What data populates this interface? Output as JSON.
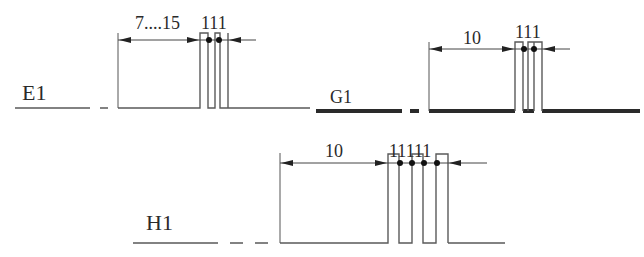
{
  "diagram": {
    "signals": [
      {
        "id": "E1",
        "label": "E1",
        "dimensions": {
          "lead": "7....15",
          "pulses": "111"
        }
      },
      {
        "id": "G1",
        "label": "G1",
        "dimensions": {
          "lead": "10",
          "pulses": "111"
        }
      },
      {
        "id": "H1",
        "label": "H1",
        "dimensions": {
          "lead": "10",
          "pulses": "11111"
        }
      }
    ],
    "colors": {
      "line": "#5a5a5a",
      "thick_line": "#2a2a2a",
      "text": "#2a2a2a"
    }
  }
}
